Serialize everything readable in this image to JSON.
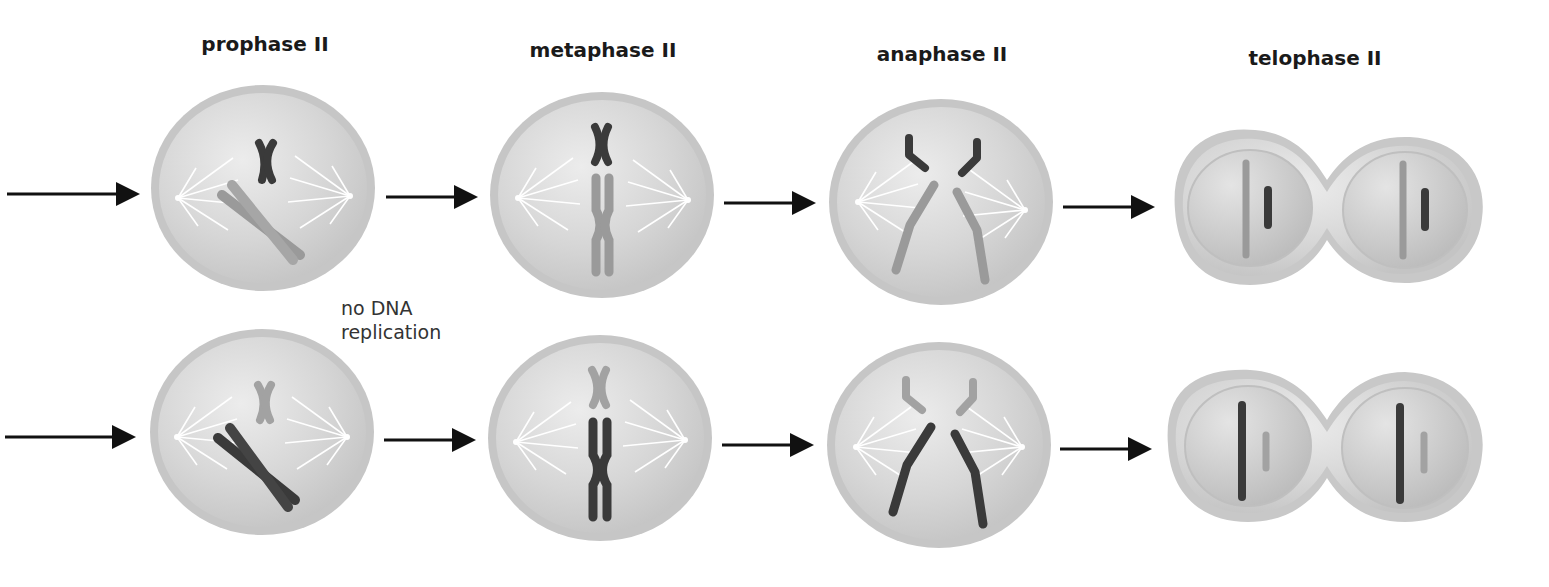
{
  "stages": [
    {
      "label": "prophase II",
      "x": 265,
      "y": 32
    },
    {
      "label": "metaphase II",
      "x": 603,
      "y": 38
    },
    {
      "label": "anaphase II",
      "x": 942,
      "y": 42
    },
    {
      "label": "telophase II",
      "x": 1315,
      "y": 46
    }
  ],
  "annotation": {
    "line1": "no DNA",
    "line2": "replication"
  },
  "colors": {
    "dark_chromosome": "#4a4a4a",
    "light_chromosome": "#9a9a9a",
    "cell_fill": "#d4d4d4",
    "cell_rim": "#bdbdbd",
    "arrow": "#111111"
  }
}
